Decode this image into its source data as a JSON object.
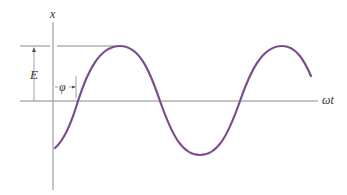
{
  "diagram": {
    "type": "sinusoid-phase-diagram",
    "labels": {
      "vertical_axis": "x",
      "horizontal_axis": "ωt",
      "amplitude": "E",
      "phase": "φ"
    },
    "colors": {
      "curve": "#7a4e8c",
      "axes": "#8a8a8a",
      "text": "#333333",
      "background": "#ffffff"
    },
    "curve": {
      "description": "sinusoid x = E sin(ωt + φ) with phase offset φ",
      "peaks_px": [
        [
          120,
          46
        ],
        [
          282,
          46
        ]
      ],
      "trough_px": [
        200,
        155
      ],
      "zero_crossings_px": [
        [
          78,
          101
        ],
        [
          240,
          101
        ]
      ],
      "start_px": [
        55,
        148
      ],
      "end_px": [
        311,
        76
      ]
    }
  }
}
